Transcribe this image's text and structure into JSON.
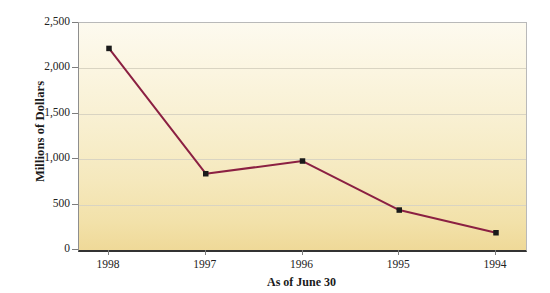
{
  "chart_data": {
    "type": "line",
    "title": "",
    "subtitle": "",
    "xlabel": "As of June 30",
    "ylabel": "Millions of Dollars",
    "categories": [
      "1998",
      "1997",
      "1996",
      "1995",
      "1994"
    ],
    "series": [
      {
        "name": "Millions of Dollars",
        "values": [
          2220,
          840,
          980,
          440,
          190
        ],
        "color": "#8B2042",
        "marker": "filled-square",
        "marker_color": "#1a1a1a"
      }
    ],
    "ylim": [
      0,
      2500
    ],
    "yticks": [
      0,
      500,
      1000,
      1500,
      2000,
      2500
    ],
    "ytick_labels": [
      "0",
      "500",
      "1,000",
      "1,500",
      "2,000",
      "2,500"
    ],
    "xtick_labels": [
      "1998",
      "1997",
      "1996",
      "1995",
      "1994"
    ],
    "grid": true,
    "grid_axis": "y",
    "legend": false,
    "legend_position": "none",
    "plot_background": "cream-tan-gradient",
    "plot_bg_top": "#fdfaef",
    "plot_bg_bottom": "#efd998",
    "gridline_color": "#d9d4c2",
    "axis_color": "#333333",
    "page_background": "#ffffff"
  }
}
